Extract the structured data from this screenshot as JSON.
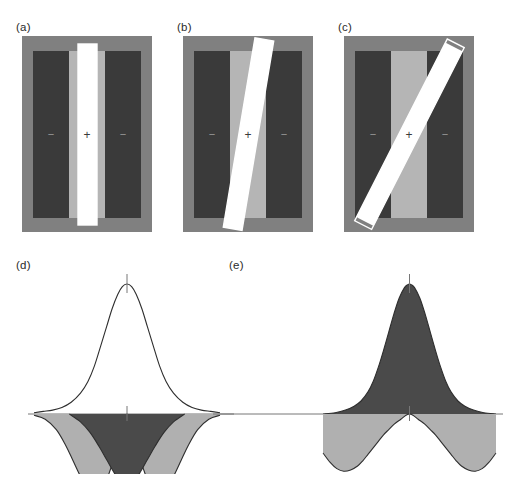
{
  "figure": {
    "background_color": "#ffffff",
    "width": 506,
    "height": 479
  },
  "palette": {
    "surround_gray": "#808080",
    "flank_dark": "#3a3a3a",
    "center_light_gray": "#b5b5b5",
    "bar_white": "#ffffff",
    "bar_black": "#111111",
    "outline_white": "#ffffff",
    "curve_stroke": "#2e2e2e",
    "fill_light_gray": "#b0b0b0",
    "fill_dark_gray": "#4a4a4a",
    "axis_gray": "#777777",
    "label_color": "#2b2b2b"
  },
  "panels": [
    {
      "id": "a",
      "label": "(a)",
      "type": "receptive-field-stimulus",
      "bar_orientation_deg": 0,
      "bar_tilt_label": "vertical, aligned with excitatory center",
      "center_sign": "+",
      "surround_sign_left": "−",
      "surround_sign_right": "−",
      "region_labels": {
        "center": "+",
        "left_surround": "−",
        "right_surround": "−"
      },
      "bar_color": "#ffffff",
      "frame": {
        "x": 22,
        "y": 36,
        "w": 130,
        "h": 196
      }
    },
    {
      "id": "b",
      "label": "(b)",
      "type": "receptive-field-stimulus",
      "bar_orientation_deg": 10,
      "bar_tilt_label": "slightly tilted, partly overlapping inhibitory surround",
      "center_sign": "+",
      "surround_sign_left": "−",
      "surround_sign_right": "−",
      "region_labels": {
        "center": "+",
        "left_surround": "−",
        "right_surround": "−"
      },
      "bar_color": "#ffffff",
      "frame": {
        "x": 183,
        "y": 36,
        "w": 130,
        "h": 196
      }
    },
    {
      "id": "c",
      "label": "(c)",
      "type": "receptive-field-stimulus",
      "bar_orientation_deg": 28,
      "bar_tilt_label": "strongly tilted, crossing both inhibitory surrounds",
      "center_sign": "+",
      "surround_sign_left": "−",
      "surround_sign_right": "−",
      "region_labels": {
        "center": "+",
        "left_surround": "−",
        "right_surround": "−"
      },
      "bar_color": "#ffffff",
      "frame": {
        "x": 344,
        "y": 36,
        "w": 130,
        "h": 196
      }
    },
    {
      "id": "d",
      "label": "(d)",
      "type": "profile-plot",
      "description": "broad excitatory profile above axis with two inhibitory lobes below axis and a dark central inhibitory region"
    },
    {
      "id": "e",
      "label": "(e)",
      "type": "profile-plot",
      "description": "narrow excitatory peak filled dark above axis with two shallow inhibitory lobes below axis"
    }
  ],
  "chart_data": [
    {
      "type": "line",
      "panel": "d",
      "title": "(d)",
      "xlabel": "",
      "ylabel": "",
      "xlim": [
        -1,
        1
      ],
      "ylim": [
        -0.62,
        1.0
      ],
      "grid": false,
      "legend": "none",
      "axis_zero_line": true,
      "center_tick_top": true,
      "center_tick_axis": true,
      "series": [
        {
          "name": "excitatory-profile",
          "role": "positive lobe (above axis)",
          "fill": "none",
          "stroke": "#2e2e2e",
          "x": [
            -1.0,
            -0.9,
            -0.8,
            -0.7,
            -0.6,
            -0.5,
            -0.42,
            -0.35,
            -0.28,
            -0.22,
            -0.16,
            -0.1,
            -0.05,
            0.0,
            0.05,
            0.1,
            0.16,
            0.22,
            0.28,
            0.35,
            0.42,
            0.5,
            0.6,
            0.7,
            0.8,
            0.9,
            1.0
          ],
          "y": [
            0.01,
            0.02,
            0.03,
            0.05,
            0.09,
            0.16,
            0.25,
            0.37,
            0.53,
            0.67,
            0.81,
            0.92,
            0.98,
            1.0,
            0.98,
            0.92,
            0.81,
            0.67,
            0.53,
            0.37,
            0.25,
            0.16,
            0.09,
            0.05,
            0.03,
            0.02,
            0.01
          ]
        },
        {
          "name": "inhibitory-lobes-light",
          "role": "negative lobes (below axis, light gray fill)",
          "fill": "#b0b0b0",
          "stroke": "#2e2e2e",
          "x": [
            -1.0,
            -0.88,
            -0.76,
            -0.66,
            -0.58,
            -0.5,
            -0.44,
            -0.38,
            -0.32,
            -0.26,
            -0.2,
            -0.14,
            -0.08,
            -0.03,
            0.0,
            0.03,
            0.08,
            0.14,
            0.2,
            0.26,
            0.32,
            0.38,
            0.44,
            0.5,
            0.58,
            0.66,
            0.76,
            0.88,
            1.0
          ],
          "y": [
            -0.01,
            -0.04,
            -0.12,
            -0.24,
            -0.36,
            -0.48,
            -0.55,
            -0.59,
            -0.6,
            -0.56,
            -0.47,
            -0.34,
            -0.17,
            -0.05,
            0.0,
            -0.05,
            -0.17,
            -0.34,
            -0.47,
            -0.56,
            -0.6,
            -0.59,
            -0.55,
            -0.48,
            -0.36,
            -0.24,
            -0.12,
            -0.04,
            -0.01
          ]
        },
        {
          "name": "central-inhibitory-dark",
          "role": "dark central region below axis",
          "fill": "#4a4a4a",
          "stroke": "#2e2e2e",
          "x": [
            -0.62,
            -0.5,
            -0.4,
            -0.3,
            -0.22,
            -0.14,
            -0.07,
            0.0,
            0.07,
            0.14,
            0.22,
            0.3,
            0.4,
            0.5,
            0.62
          ],
          "y": [
            0.0,
            -0.06,
            -0.14,
            -0.25,
            -0.35,
            -0.45,
            -0.52,
            -0.55,
            -0.52,
            -0.45,
            -0.35,
            -0.25,
            -0.14,
            -0.06,
            0.0
          ]
        }
      ]
    },
    {
      "type": "line",
      "panel": "e",
      "title": "(e)",
      "xlabel": "",
      "ylabel": "",
      "xlim": [
        -1,
        1
      ],
      "ylim": [
        -0.45,
        1.0
      ],
      "grid": false,
      "legend": "none",
      "axis_zero_line": true,
      "center_tick_top": true,
      "center_tick_axis": true,
      "series": [
        {
          "name": "excitatory-peak-dark",
          "role": "positive peak (above axis, dark fill)",
          "fill": "#4a4a4a",
          "stroke": "#2e2e2e",
          "x": [
            -1.0,
            -0.86,
            -0.74,
            -0.64,
            -0.56,
            -0.48,
            -0.42,
            -0.36,
            -0.3,
            -0.24,
            -0.18,
            -0.12,
            -0.06,
            -0.02,
            0.0,
            0.02,
            0.06,
            0.12,
            0.18,
            0.24,
            0.3,
            0.36,
            0.42,
            0.48,
            0.56,
            0.64,
            0.74,
            0.86,
            1.0
          ],
          "y": [
            0.0,
            0.01,
            0.03,
            0.06,
            0.1,
            0.17,
            0.25,
            0.36,
            0.49,
            0.63,
            0.77,
            0.89,
            0.97,
            0.995,
            1.0,
            0.995,
            0.97,
            0.89,
            0.77,
            0.63,
            0.49,
            0.36,
            0.25,
            0.17,
            0.1,
            0.06,
            0.03,
            0.01,
            0.0
          ]
        },
        {
          "name": "inhibitory-lobes-light",
          "role": "negative lobes (below axis, light gray fill)",
          "fill": "#b0b0b0",
          "stroke": "#2e2e2e",
          "x": [
            -1.0,
            -0.92,
            -0.84,
            -0.76,
            -0.68,
            -0.6,
            -0.54,
            -0.48,
            -0.42,
            -0.36,
            -0.3,
            -0.24,
            -0.18,
            -0.1,
            -0.04,
            0.0,
            0.04,
            0.1,
            0.18,
            0.24,
            0.3,
            0.36,
            0.42,
            0.48,
            0.54,
            0.6,
            0.68,
            0.76,
            0.84,
            0.92,
            1.0
          ],
          "y": [
            -0.3,
            -0.37,
            -0.42,
            -0.44,
            -0.43,
            -0.4,
            -0.36,
            -0.31,
            -0.26,
            -0.21,
            -0.16,
            -0.12,
            -0.08,
            -0.04,
            -0.01,
            0.0,
            -0.01,
            -0.04,
            -0.08,
            -0.12,
            -0.16,
            -0.21,
            -0.26,
            -0.31,
            -0.36,
            -0.4,
            -0.43,
            -0.44,
            -0.42,
            -0.37,
            -0.3
          ]
        }
      ]
    }
  ]
}
